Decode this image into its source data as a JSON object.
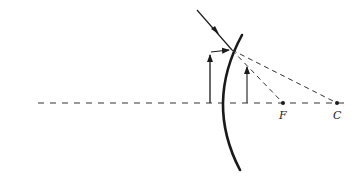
{
  "diagram": {
    "labels": {
      "focal_point": "F",
      "center_of_curvature": "C"
    },
    "colors": {
      "ink": "#1a1a1a",
      "dashed": "#333333"
    },
    "elements": [
      "optical-axis",
      "convex-mirror",
      "incident-ray",
      "object-arrow",
      "image-arrow",
      "reflected-ray-to-focal",
      "ray-to-center"
    ]
  }
}
